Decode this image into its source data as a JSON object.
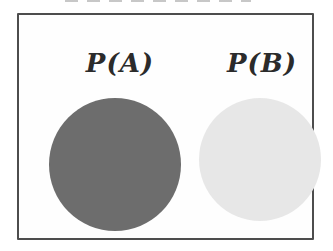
{
  "diagram": {
    "type": "venn-style probability diagram",
    "labels": {
      "left": "P(A)",
      "right": "P(B)"
    },
    "circles": [
      {
        "name": "set-A",
        "label": "P(A)",
        "fill_color": "#6d6d6d"
      },
      {
        "name": "set-B",
        "label": "P(B)",
        "fill_color": "#e7e7e7"
      }
    ],
    "colors": {
      "frame_border": "#4d4d4d",
      "background": "#ffffff",
      "label_text": "#2b2b2b"
    }
  }
}
